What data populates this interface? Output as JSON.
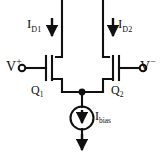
{
  "diagram": {
    "background_color": "#ffffff",
    "line_color": "#101010",
    "labels": {
      "drain_current_left": {
        "symbol": "I",
        "subscript": "D1"
      },
      "drain_current_right": {
        "symbol": "I",
        "subscript": "D2"
      },
      "input_positive": {
        "symbol": "V",
        "superscript": "+"
      },
      "input_negative": {
        "symbol": "V",
        "superscript": "−"
      },
      "transistor_left": {
        "symbol": "Q",
        "subscript": "1"
      },
      "transistor_right": {
        "symbol": "Q",
        "subscript": "2"
      },
      "bias_current": {
        "symbol": "I",
        "subscript": "bias"
      }
    },
    "components": [
      {
        "name": "mosfet-q1",
        "type": "nmos-transistor",
        "label": "Q1"
      },
      {
        "name": "mosfet-q2",
        "type": "nmos-transistor",
        "label": "Q2"
      },
      {
        "name": "current-source-ibias",
        "type": "current-source",
        "label": "Ibias"
      },
      {
        "name": "terminal-vplus",
        "type": "input-terminal",
        "label": "V+"
      },
      {
        "name": "terminal-vminus",
        "type": "input-terminal",
        "label": "V-"
      },
      {
        "name": "node-tail",
        "type": "junction-dot"
      }
    ]
  }
}
